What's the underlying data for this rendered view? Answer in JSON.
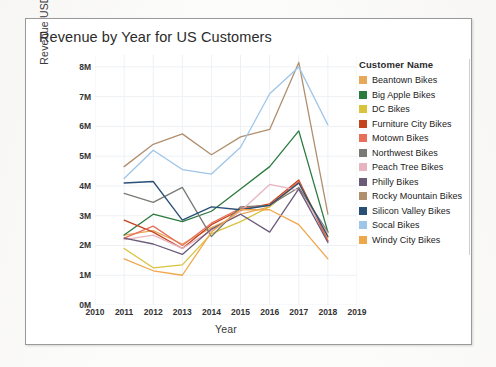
{
  "chart_data": {
    "type": "line",
    "title": "Revenue by Year for US Customers",
    "xlabel": "Year",
    "ylabel": "Revenue USD",
    "x": [
      2011,
      2012,
      2013,
      2014,
      2015,
      2016,
      2017,
      2018
    ],
    "xlim": [
      2010,
      2019
    ],
    "ylim": [
      0,
      8400000
    ],
    "x_ticks": [
      "2010",
      "2011",
      "2012",
      "2013",
      "2014",
      "2015",
      "2016",
      "2017",
      "2018",
      "2019"
    ],
    "y_ticks": [
      "0M",
      "1M",
      "2M",
      "3M",
      "4M",
      "5M",
      "6M",
      "7M",
      "8M"
    ],
    "y_tick_values": [
      0,
      1000000,
      2000000,
      3000000,
      4000000,
      5000000,
      6000000,
      7000000,
      8000000
    ],
    "grid": "faint-both",
    "legend_position": "right",
    "legend_title": "Customer Name",
    "series": [
      {
        "name": "Beantown Bikes",
        "color": "#e8a85c",
        "values": [
          2350000,
          2500000,
          2050000,
          2600000,
          3050000,
          3300000,
          4100000,
          2250000
        ]
      },
      {
        "name": "Big Apple Bikes",
        "color": "#2b7a3e",
        "values": [
          2350000,
          3050000,
          2800000,
          3150000,
          3900000,
          4650000,
          5850000,
          2450000
        ]
      },
      {
        "name": "DC Bikes",
        "color": "#d8c33a",
        "values": [
          1900000,
          1250000,
          1350000,
          2400000,
          2800000,
          3300000,
          4150000,
          2300000
        ]
      },
      {
        "name": "Furniture City Bikes",
        "color": "#c4421d",
        "values": [
          2850000,
          2450000,
          1900000,
          2700000,
          3200000,
          3400000,
          4200000,
          2150000
        ]
      },
      {
        "name": "Motown Bikes",
        "color": "#e8705a",
        "values": [
          2250000,
          2650000,
          2000000,
          2750000,
          3250000,
          3350000,
          4150000,
          2150000
        ]
      },
      {
        "name": "Northwest Bikes",
        "color": "#7a7a74",
        "values": [
          3750000,
          3450000,
          3950000,
          2300000,
          3300000,
          3350000,
          3950000,
          2450000
        ]
      },
      {
        "name": "Peach Tree Bikes",
        "color": "#e8b4c0",
        "values": [
          2200000,
          2350000,
          1900000,
          2500000,
          3150000,
          4050000,
          3850000,
          2400000
        ]
      },
      {
        "name": "Philly Bikes",
        "color": "#6b5a78",
        "values": [
          2250000,
          2050000,
          1700000,
          2550000,
          3050000,
          2450000,
          3900000,
          2100000
        ]
      },
      {
        "name": "Rocky Mountain Bikes",
        "color": "#b08f6e",
        "values": [
          4650000,
          5400000,
          5750000,
          5050000,
          5650000,
          5900000,
          8150000,
          3050000
        ]
      },
      {
        "name": "Silicon Valley Bikes",
        "color": "#2a4f75",
        "values": [
          4100000,
          4150000,
          2850000,
          3300000,
          3200000,
          3350000,
          4100000,
          2300000
        ]
      },
      {
        "name": "Socal Bikes",
        "color": "#9fc5e8",
        "values": [
          4250000,
          5200000,
          4550000,
          4400000,
          5300000,
          7100000,
          8000000,
          6050000
        ]
      },
      {
        "name": "Windy City Bikes",
        "color": "#f0a64a",
        "values": [
          1550000,
          1150000,
          1000000,
          2450000,
          3200000,
          3200000,
          2700000,
          1550000
        ]
      }
    ]
  }
}
